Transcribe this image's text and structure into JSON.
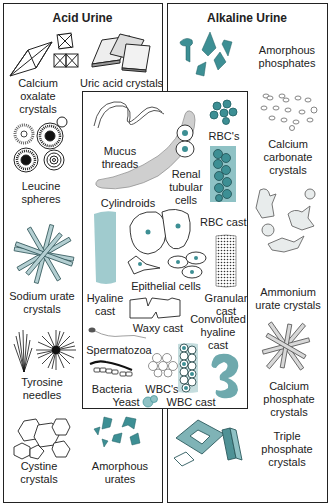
{
  "figure": {
    "colors": {
      "teal": "#3d8f94",
      "teal_light": "#8fc2c5",
      "outline": "#222222",
      "gray_fill": "#cfcfcf"
    },
    "acid_urine": {
      "title": "Acid Urine",
      "items": [
        {
          "label": "Calcium oxalate crystals",
          "lines": [
            "Calcium",
            "oxalate",
            "crystals"
          ],
          "icon": "octahedral-envelope-crystals"
        },
        {
          "label": "Uric acid crystals",
          "lines": [
            "Uric acid crystals"
          ],
          "icon": "rhomboid-plate-crystals"
        },
        {
          "label": "Leucine spheres",
          "lines": [
            "Leucine",
            "spheres"
          ],
          "icon": "concentric-spheres"
        },
        {
          "label": "Sodium urate crystals",
          "lines": [
            "Sodium urate",
            "crystals"
          ],
          "icon": "radiating-prisms"
        },
        {
          "label": "Tyrosine needles",
          "lines": [
            "Tyrosine",
            "needles"
          ],
          "icon": "needle-sheaves"
        },
        {
          "label": "Cystine crystals",
          "lines": [
            "Cystine",
            "crystals"
          ],
          "icon": "hexagonal-plates"
        },
        {
          "label": "Amorphous urates",
          "lines": [
            "Amorphous",
            "urates"
          ],
          "icon": "teal-amorphous-granules"
        }
      ]
    },
    "alkaline_urine": {
      "title": "Alkaline Urine",
      "items": [
        {
          "label": "Amorphous phosphates",
          "lines": [
            "Amorphous",
            "phosphates"
          ],
          "icon": "teal-amorphous-granules"
        },
        {
          "label": "Calcium carbonate crystals",
          "lines": [
            "Calcium",
            "carbonate",
            "crystals"
          ],
          "icon": "dumbbell-granules"
        },
        {
          "label": "Ammonium urate crystals",
          "lines": [
            "Ammonium",
            "urate crystals"
          ],
          "icon": "thorny-apple-spheres"
        },
        {
          "label": "Calcium phosphate crystals",
          "lines": [
            "Calcium",
            "phosphate",
            "crystals"
          ],
          "icon": "radiating-prisms"
        },
        {
          "label": "Triple phosphate crystals",
          "lines": [
            "Triple",
            "phosphate",
            "crystals"
          ],
          "icon": "coffin-lid-prisms"
        }
      ]
    },
    "sediment": {
      "items": [
        {
          "label": "Mucus threads",
          "lines": [
            "Mucus",
            "threads"
          ]
        },
        {
          "label": "Cylindroids",
          "lines": [
            "Cylindroids"
          ]
        },
        {
          "label": "Renal tubular cells",
          "lines": [
            "Renal",
            "tubular",
            "cells"
          ]
        },
        {
          "label": "RBC's",
          "lines": [
            "RBC's"
          ]
        },
        {
          "label": "RBC cast",
          "lines": [
            "RBC cast"
          ]
        },
        {
          "label": "Hyaline cast",
          "lines": [
            "Hyaline",
            "cast"
          ]
        },
        {
          "label": "Epithelial cells",
          "lines": [
            "Epithelial cells"
          ]
        },
        {
          "label": "Granular cast",
          "lines": [
            "Granular",
            "cast"
          ]
        },
        {
          "label": "Waxy cast",
          "lines": [
            "Waxy cast"
          ]
        },
        {
          "label": "Convoluted hyaline cast",
          "lines": [
            "Convoluted",
            "hyaline",
            "cast"
          ]
        },
        {
          "label": "Spermatozoa",
          "lines": [
            "Spermatozoa"
          ]
        },
        {
          "label": "Bacteria",
          "lines": [
            "Bacteria"
          ]
        },
        {
          "label": "WBC's",
          "lines": [
            "WBC's"
          ]
        },
        {
          "label": "Yeast",
          "lines": [
            "Yeast"
          ]
        },
        {
          "label": "WBC cast",
          "lines": [
            "WBC cast"
          ]
        }
      ]
    }
  }
}
